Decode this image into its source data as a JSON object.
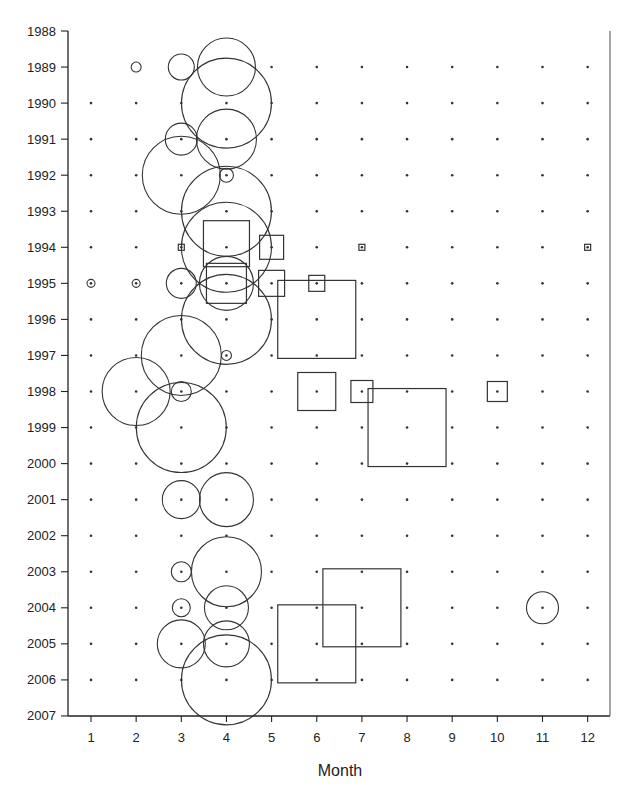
{
  "chart_data": {
    "type": "scatter",
    "subtype": "bubble-grid",
    "title": "",
    "xlabel": "Month",
    "ylabel": "",
    "x_ticks": [
      1,
      2,
      3,
      4,
      5,
      6,
      7,
      8,
      9,
      10,
      11,
      12
    ],
    "y_ticks": [
      1988,
      1989,
      1990,
      1991,
      1992,
      1993,
      1994,
      1995,
      1996,
      1997,
      1998,
      1999,
      2000,
      2001,
      2002,
      2003,
      2004,
      2005,
      2006,
      2007
    ],
    "xlim": [
      0.5,
      12.5
    ],
    "ylim": [
      2007,
      1988
    ],
    "y_inverted": true,
    "grid": "dot markers at every month/year cell (1989-2006)",
    "legend": null,
    "series": [
      {
        "name": "circles",
        "marker": "circle",
        "points": [
          {
            "month": 2,
            "year": 1989,
            "size": 5
          },
          {
            "month": 3,
            "year": 1989,
            "size": 13
          },
          {
            "month": 4,
            "year": 1989,
            "size": 29
          },
          {
            "month": 4,
            "year": 1990,
            "size": 45
          },
          {
            "month": 3,
            "year": 1991,
            "size": 16
          },
          {
            "month": 4,
            "year": 1991,
            "size": 30
          },
          {
            "month": 3,
            "year": 1992,
            "size": 39
          },
          {
            "month": 4,
            "year": 1992,
            "size": 7
          },
          {
            "month": 4,
            "year": 1993,
            "size": 45
          },
          {
            "month": 4,
            "year": 1994,
            "size": 45
          },
          {
            "month": 1,
            "year": 1995,
            "size": 4
          },
          {
            "month": 2,
            "year": 1995,
            "size": 4
          },
          {
            "month": 3,
            "year": 1995,
            "size": 15
          },
          {
            "month": 4,
            "year": 1995,
            "size": 27
          },
          {
            "month": 4,
            "year": 1996,
            "size": 45
          },
          {
            "month": 3,
            "year": 1997,
            "size": 40
          },
          {
            "month": 4,
            "year": 1997,
            "size": 5
          },
          {
            "month": 2,
            "year": 1998,
            "size": 34
          },
          {
            "month": 3,
            "year": 1998,
            "size": 10
          },
          {
            "month": 3,
            "year": 1999,
            "size": 45
          },
          {
            "month": 3,
            "year": 2001,
            "size": 19
          },
          {
            "month": 4,
            "year": 2001,
            "size": 27
          },
          {
            "month": 3,
            "year": 2003,
            "size": 10
          },
          {
            "month": 4,
            "year": 2003,
            "size": 35
          },
          {
            "month": 3,
            "year": 2004,
            "size": 9
          },
          {
            "month": 4,
            "year": 2004,
            "size": 22
          },
          {
            "month": 11,
            "year": 2004,
            "size": 16
          },
          {
            "month": 3,
            "year": 2005,
            "size": 24
          },
          {
            "month": 4,
            "year": 2005,
            "size": 23
          },
          {
            "month": 4,
            "year": 2006,
            "size": 45
          }
        ]
      },
      {
        "name": "squares",
        "marker": "square",
        "points": [
          {
            "month": 3,
            "year": 1994,
            "size": 3
          },
          {
            "month": 4,
            "year": 1993.9,
            "size": 23
          },
          {
            "month": 5,
            "year": 1994,
            "size": 12
          },
          {
            "month": 7,
            "year": 1994,
            "size": 3
          },
          {
            "month": 12,
            "year": 1994,
            "size": 3
          },
          {
            "month": 4,
            "year": 1995,
            "size": 20
          },
          {
            "month": 5,
            "year": 1995,
            "size": 13
          },
          {
            "month": 6,
            "year": 1995,
            "size": 8
          },
          {
            "month": 6,
            "year": 1996,
            "size": 39
          },
          {
            "month": 6,
            "year": 1998,
            "size": 19
          },
          {
            "month": 7,
            "year": 1998,
            "size": 11
          },
          {
            "month": 8,
            "year": 1999,
            "size": 39
          },
          {
            "month": 10,
            "year": 1998,
            "size": 10
          },
          {
            "month": 7,
            "year": 2004,
            "size": 39
          },
          {
            "month": 6,
            "year": 2005,
            "size": 39
          }
        ]
      }
    ],
    "dot_rows": {
      "1989": [
        5,
        6,
        7,
        8,
        9,
        10,
        11,
        12
      ],
      "default": [
        1,
        2,
        3,
        4,
        5,
        6,
        7,
        8,
        9,
        10,
        11,
        12
      ],
      "years_with_dots": [
        1989,
        1990,
        1991,
        1992,
        1993,
        1994,
        1995,
        1996,
        1997,
        1998,
        1999,
        2000,
        2001,
        2002,
        2003,
        2004,
        2005,
        2006
      ]
    }
  },
  "colors": {
    "stroke": "#333333",
    "axis": "#222222",
    "background": "#ffffff",
    "right_border": "#777777"
  }
}
